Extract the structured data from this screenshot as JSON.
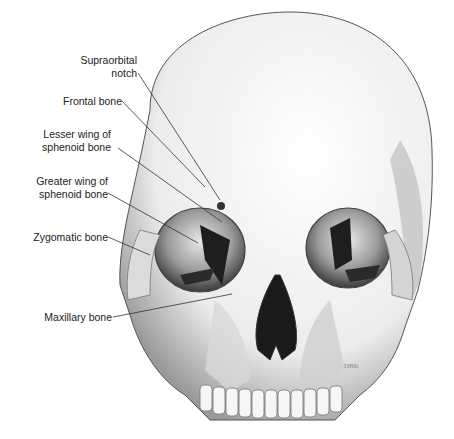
{
  "figure": {
    "labels": [
      {
        "id": "supraorbital-notch",
        "text": "Supraorbital\nnotch"
      },
      {
        "id": "frontal-bone",
        "text": "Frontal bone"
      },
      {
        "id": "lesser-wing",
        "text": "Lesser wing of\nsphenoid bone"
      },
      {
        "id": "greater-wing",
        "text": "Greater wing of\nsphenoid bone"
      },
      {
        "id": "zygomatic-bone",
        "text": "Zygomatic bone"
      },
      {
        "id": "maxillary-bone",
        "text": "Maxillary bone"
      }
    ],
    "signature": "DBK"
  }
}
